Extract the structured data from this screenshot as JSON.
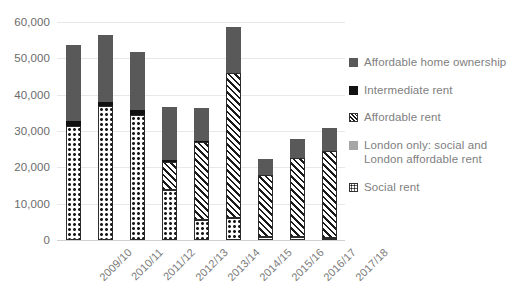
{
  "chart_data": {
    "type": "bar",
    "stacked": true,
    "title": "",
    "xlabel": "",
    "ylabel": "",
    "ylim": [
      0,
      60000
    ],
    "ytick_step": 10000,
    "grid": true,
    "legend_position": "right",
    "categories": [
      "2009/10",
      "2010/11",
      "2011/12",
      "2012/13",
      "2013/14",
      "2014/15",
      "2015/16",
      "2016/17",
      "2017/18"
    ],
    "ytick_labels": [
      "60,000",
      "50,000",
      "40,000",
      "30,000",
      "20,000",
      "10,000",
      "0"
    ],
    "ytick_values": [
      60000,
      50000,
      40000,
      30000,
      20000,
      10000,
      0
    ],
    "series": [
      {
        "name": "Social rent",
        "fill": "social",
        "values": [
          31500,
          37000,
          34500,
          13800,
          5500,
          6000,
          800,
          700,
          600
        ]
      },
      {
        "name": "London only: social and London affordable rent",
        "fill": "london",
        "values": [
          0,
          0,
          0,
          0,
          0,
          0,
          0,
          0,
          0
        ]
      },
      {
        "name": "Affordable rent",
        "fill": "afford",
        "values": [
          0,
          0,
          0,
          7700,
          21500,
          40000,
          17000,
          22000,
          23800
        ]
      },
      {
        "name": "Intermediate rent",
        "fill": "inter",
        "values": [
          1200,
          1100,
          1300,
          400,
          300,
          0,
          0,
          0,
          0
        ]
      },
      {
        "name": "Affordable home ownership",
        "fill": "aho",
        "values": [
          21000,
          18300,
          16000,
          14800,
          9000,
          12500,
          4400,
          5100,
          6500
        ]
      }
    ],
    "totals": [
      53700,
      56400,
      51800,
      36700,
      36300,
      58500,
      22200,
      27800,
      30900
    ]
  },
  "legend": {
    "items": [
      {
        "label": "Affordable home ownership",
        "fill": "aho"
      },
      {
        "label": "Intermediate rent",
        "fill": "inter"
      },
      {
        "label": "Affordable rent",
        "fill": "afford"
      },
      {
        "label": "London only: social and London affordable rent",
        "fill": "london"
      },
      {
        "label": "Social rent",
        "fill": "social"
      }
    ]
  },
  "colors": {
    "affordable_home_ownership": "#595959",
    "intermediate_rent": "#111111",
    "affordable_rent": "#1a1a1a",
    "london_only": "#a6a6a6",
    "social_rent": "#1a1a1a",
    "gridline": "#e8e8e8",
    "axis_text": "#6b6b6b",
    "legend_text": "#808080",
    "background": "#ffffff"
  }
}
